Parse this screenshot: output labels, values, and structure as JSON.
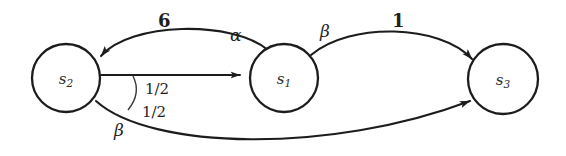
{
  "diagram": {
    "type": "state-transition-diagram",
    "background_color": "#ffffff",
    "stroke_color": "#1c1c1c",
    "nodes": [
      {
        "id": "s2",
        "base": "s",
        "sub": "2",
        "cx": 66,
        "cy": 78,
        "r": 34
      },
      {
        "id": "s1",
        "base": "s",
        "sub": "1",
        "cx": 284,
        "cy": 78,
        "r": 34
      },
      {
        "id": "s3",
        "base": "s",
        "sub": "3",
        "cx": 503,
        "cy": 79,
        "r": 35
      }
    ],
    "edges": [
      {
        "id": "e-s1-s2-top",
        "from": "s1",
        "to": "s2",
        "shape": "arc-above",
        "weight": "6",
        "action": "α"
      },
      {
        "id": "e-s2-s1-mid",
        "from": "s2",
        "to": "s1",
        "shape": "straight",
        "prob": "1/2"
      },
      {
        "id": "e-s2-s3-bottom",
        "from": "s2",
        "to": "s3",
        "shape": "arc-below",
        "prob": "1/2",
        "action": "β"
      },
      {
        "id": "e-s1-s3-top",
        "from": "s1",
        "to": "s3",
        "shape": "arc-above",
        "weight": "1",
        "action": "β"
      }
    ],
    "labels": {
      "weight_s1_s2": "6",
      "action_alpha": "α",
      "action_beta_upper": "β",
      "weight_s1_s3": "1",
      "prob_upper": "1/2",
      "prob_lower": "1/2",
      "action_beta_lower": "β"
    }
  }
}
